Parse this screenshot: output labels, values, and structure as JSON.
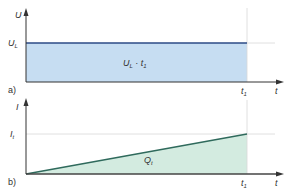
{
  "diagram_a": {
    "panel_label": "a)",
    "y_axis_label": "U",
    "level_label": "U",
    "level_sub": "L",
    "area_label_main": "U",
    "area_label_sub": "L",
    "area_label_mid": " · t",
    "area_label_sub2": "1",
    "x_tick": "t",
    "x_tick_sub": "1",
    "x_axis_label": "t",
    "fill_color": "#c6ddf2",
    "line_color": "#2b4a86"
  },
  "diagram_b": {
    "panel_label": "b)",
    "y_axis_label": "I",
    "level_label": "I",
    "level_sub": "t",
    "area_label_main": "Q",
    "area_label_sub": "t",
    "x_tick": "t",
    "x_tick_sub": "1",
    "x_axis_label": "t",
    "fill_color": "#d3ebe0",
    "line_color": "#2f6a5c"
  }
}
